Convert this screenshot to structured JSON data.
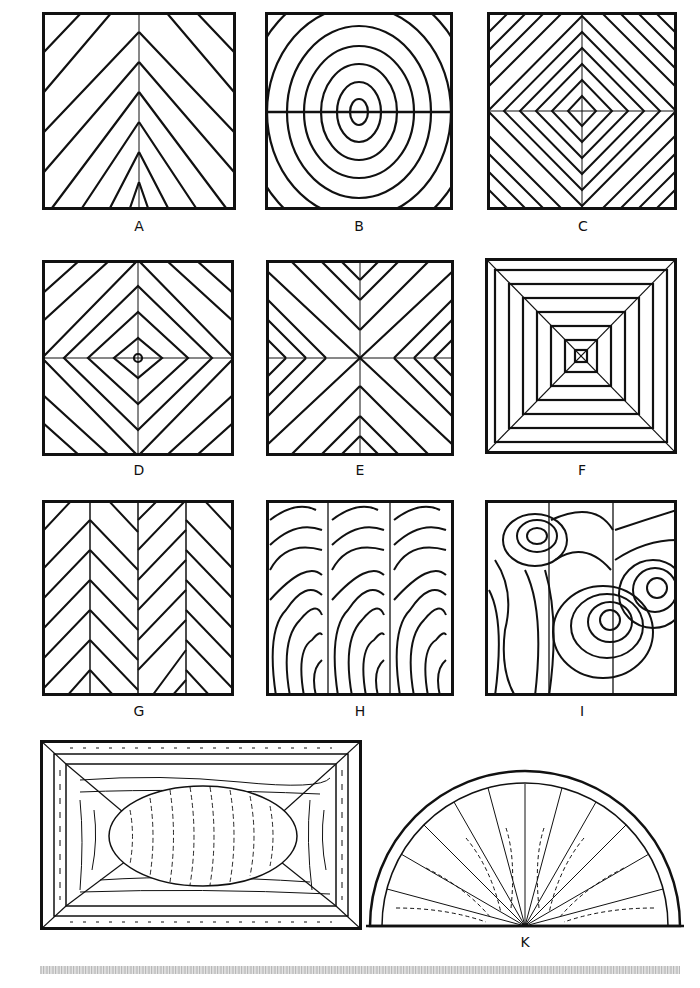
{
  "figure": {
    "panels": [
      {
        "id": "A",
        "label": "A",
        "pattern": "book-match-chevron"
      },
      {
        "id": "B",
        "label": "B",
        "pattern": "book-match-oval-rings"
      },
      {
        "id": "C",
        "label": "C",
        "pattern": "four-way-diamond-fine"
      },
      {
        "id": "D",
        "label": "D",
        "pattern": "four-way-diamond"
      },
      {
        "id": "E",
        "label": "E",
        "pattern": "four-way-reverse-diamond"
      },
      {
        "id": "F",
        "label": "F",
        "pattern": "concentric-square-mitred"
      },
      {
        "id": "G",
        "label": "G",
        "pattern": "herringbone-four-leaf"
      },
      {
        "id": "H",
        "label": "H",
        "pattern": "slip-match-three-leaf"
      },
      {
        "id": "I",
        "label": "I",
        "pattern": "random-burr-three-leaf"
      },
      {
        "id": "J",
        "label": "",
        "pattern": "panel-with-oval-and-crossbanding"
      },
      {
        "id": "K",
        "label": "K",
        "pattern": "sunburst-half-round"
      }
    ]
  },
  "colors": {
    "ink": "#111111",
    "paper": "#ffffff"
  }
}
